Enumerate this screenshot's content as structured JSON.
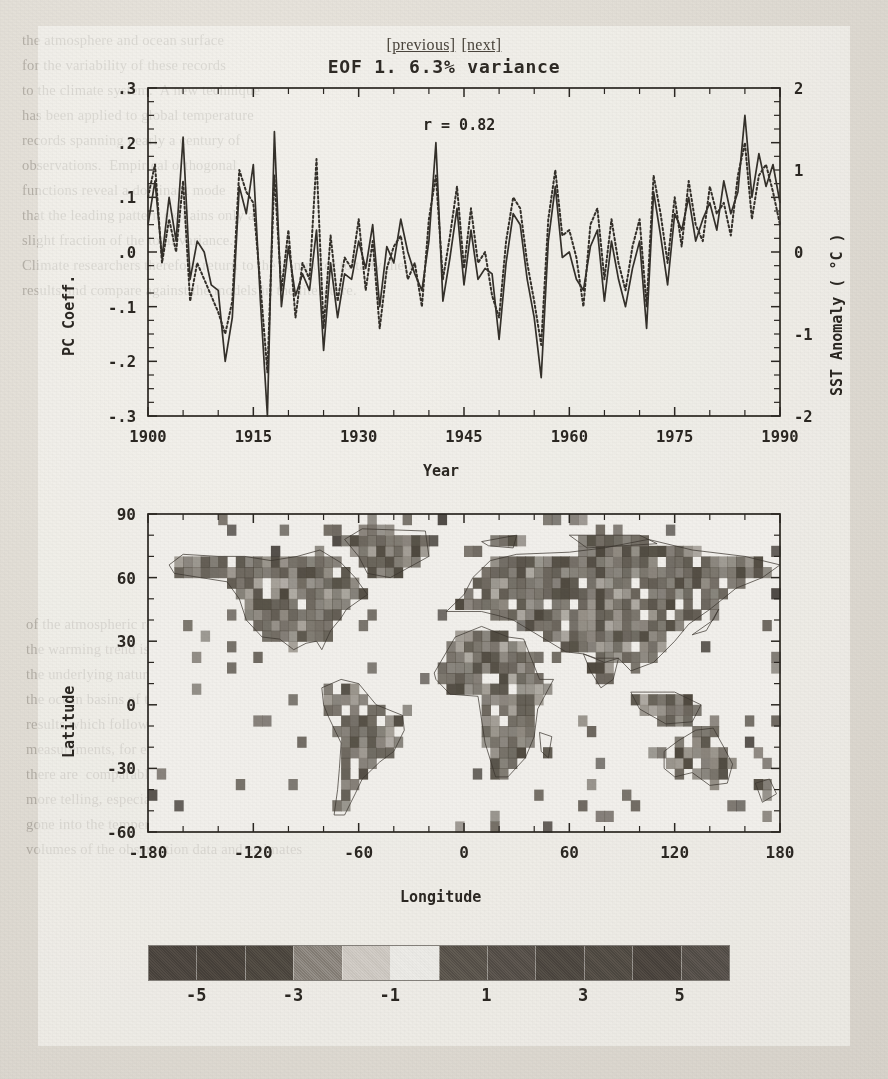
{
  "nav": {
    "previous_label": "[previous]",
    "next_label": "[next]"
  },
  "figure": {
    "title": "EOF 1.  6.3% variance"
  },
  "chart_data": [
    {
      "type": "line",
      "title": "EOF 1.  6.3% variance",
      "xlabel": "Year",
      "ylabel": "PC Coeff.",
      "ylabel_right": "SST Anomaly ( °C )",
      "annotation": "r = 0.82",
      "xlim": [
        1900,
        1990
      ],
      "ylim": [
        -0.3,
        0.3
      ],
      "ylim_right": [
        -2,
        2
      ],
      "grid": false,
      "xticks": [
        1900,
        1915,
        1930,
        1945,
        1960,
        1975,
        1990
      ],
      "xticklabels": [
        "1900",
        "1915",
        "1930",
        "1945",
        "1960",
        "1975",
        "1990"
      ],
      "yticks": [
        0.3,
        0.2,
        0.1,
        0.0,
        -0.1,
        -0.2,
        -0.3
      ],
      "yticklabels": [
        ".3",
        ".2",
        ".1",
        ".0",
        "-.1",
        "-.2",
        "-.3"
      ],
      "yticks_right": [
        2,
        1,
        0,
        -1,
        -2
      ],
      "yticklabels_right": [
        "2",
        "1",
        "0",
        "-1",
        "-2"
      ],
      "series": [
        {
          "name": "PC Coeff. (solid)",
          "style": "solid",
          "x": [
            1900,
            1901,
            1902,
            1903,
            1904,
            1905,
            1906,
            1907,
            1908,
            1909,
            1910,
            1911,
            1912,
            1913,
            1914,
            1915,
            1916,
            1917,
            1918,
            1919,
            1920,
            1921,
            1922,
            1923,
            1924,
            1925,
            1926,
            1927,
            1928,
            1929,
            1930,
            1931,
            1932,
            1933,
            1934,
            1935,
            1936,
            1937,
            1938,
            1939,
            1940,
            1941,
            1942,
            1943,
            1944,
            1945,
            1946,
            1947,
            1948,
            1949,
            1950,
            1951,
            1952,
            1953,
            1954,
            1955,
            1956,
            1957,
            1958,
            1959,
            1960,
            1961,
            1962,
            1963,
            1964,
            1965,
            1966,
            1967,
            1968,
            1969,
            1970,
            1971,
            1972,
            1973,
            1974,
            1975,
            1976,
            1977,
            1978,
            1979,
            1980,
            1981,
            1982,
            1983,
            1984,
            1985,
            1986,
            1987,
            1988,
            1989,
            1990
          ],
          "values": [
            0.05,
            0.13,
            -0.01,
            0.1,
            0.02,
            0.21,
            -0.05,
            0.02,
            0.0,
            -0.06,
            -0.07,
            -0.2,
            -0.12,
            0.12,
            0.07,
            0.16,
            -0.09,
            -0.3,
            0.22,
            -0.1,
            0.01,
            -0.08,
            -0.04,
            -0.07,
            0.04,
            -0.18,
            -0.02,
            -0.12,
            -0.04,
            -0.05,
            0.02,
            -0.03,
            0.05,
            -0.1,
            0.01,
            -0.02,
            0.06,
            0.0,
            -0.04,
            -0.07,
            0.02,
            0.2,
            -0.09,
            -0.01,
            0.08,
            -0.06,
            0.04,
            -0.05,
            -0.03,
            -0.04,
            -0.16,
            -0.02,
            0.07,
            0.05,
            -0.05,
            -0.12,
            -0.23,
            0.02,
            0.12,
            -0.01,
            0.0,
            -0.05,
            -0.07,
            0.01,
            0.04,
            -0.09,
            0.02,
            -0.05,
            -0.1,
            -0.03,
            0.02,
            -0.14,
            0.11,
            0.03,
            -0.06,
            0.07,
            0.04,
            0.1,
            0.02,
            0.06,
            0.09,
            0.04,
            0.13,
            0.07,
            0.11,
            0.25,
            0.1,
            0.18,
            0.12,
            0.16,
            0.09
          ]
        },
        {
          "name": "SST Anomaly (dotted)",
          "style": "dotted",
          "x": [
            1900,
            1901,
            1902,
            1903,
            1904,
            1905,
            1906,
            1907,
            1908,
            1909,
            1910,
            1911,
            1912,
            1913,
            1914,
            1915,
            1916,
            1917,
            1918,
            1919,
            1920,
            1921,
            1922,
            1923,
            1924,
            1925,
            1926,
            1927,
            1928,
            1929,
            1930,
            1931,
            1932,
            1933,
            1934,
            1935,
            1936,
            1937,
            1938,
            1939,
            1940,
            1941,
            1942,
            1943,
            1944,
            1945,
            1946,
            1947,
            1948,
            1949,
            1950,
            1951,
            1952,
            1953,
            1954,
            1955,
            1956,
            1957,
            1958,
            1959,
            1960,
            1961,
            1962,
            1963,
            1964,
            1965,
            1966,
            1967,
            1968,
            1969,
            1970,
            1971,
            1972,
            1973,
            1974,
            1975,
            1976,
            1977,
            1978,
            1979,
            1980,
            1981,
            1982,
            1983,
            1984,
            1985,
            1986,
            1987,
            1988,
            1989,
            1990
          ],
          "values": [
            0.1,
            0.16,
            -0.02,
            0.06,
            0.0,
            0.13,
            -0.09,
            -0.02,
            -0.05,
            -0.08,
            -0.11,
            -0.15,
            -0.09,
            0.15,
            0.11,
            0.09,
            -0.06,
            -0.22,
            0.14,
            -0.07,
            0.04,
            -0.12,
            -0.02,
            -0.05,
            0.17,
            -0.14,
            0.03,
            -0.09,
            -0.01,
            -0.03,
            0.06,
            -0.07,
            0.02,
            -0.14,
            -0.03,
            0.01,
            0.03,
            -0.05,
            -0.02,
            -0.1,
            0.06,
            0.14,
            -0.05,
            0.03,
            0.12,
            -0.03,
            0.08,
            -0.02,
            0.0,
            -0.08,
            -0.12,
            0.02,
            0.1,
            0.08,
            -0.02,
            -0.09,
            -0.17,
            0.06,
            0.15,
            0.03,
            0.04,
            -0.01,
            -0.1,
            0.05,
            0.08,
            -0.05,
            0.06,
            -0.02,
            -0.07,
            0.01,
            0.06,
            -0.1,
            0.14,
            0.07,
            -0.02,
            0.1,
            0.01,
            0.13,
            0.05,
            0.02,
            0.12,
            0.07,
            0.09,
            0.03,
            0.14,
            0.2,
            0.06,
            0.14,
            0.16,
            0.11,
            0.05
          ]
        }
      ]
    },
    {
      "type": "scatter",
      "title": "",
      "xlabel": "Longitude",
      "ylabel": "Latitude",
      "xlim": [
        -180,
        180
      ],
      "ylim": [
        -60,
        90
      ],
      "grid": false,
      "xticks": [
        -180,
        -120,
        -60,
        0,
        60,
        120,
        180
      ],
      "xticklabels": [
        "-180",
        "-120",
        "-60",
        "0",
        "60",
        "120",
        "180"
      ],
      "yticks": [
        90,
        60,
        30,
        0,
        -30,
        -60
      ],
      "yticklabels": [
        "90",
        "60",
        "30",
        "0",
        "-30",
        "-60"
      ],
      "description": "World map with shaded grid cells over continents and scattered ocean points"
    }
  ],
  "colorbar": {
    "ticks": [
      "-5",
      "-3",
      "-1",
      "1",
      "3",
      "5"
    ],
    "tick_values": [
      -5,
      -3,
      -1,
      1,
      3,
      5
    ],
    "range": [
      -6,
      6
    ],
    "colors": [
      "#4c463f",
      "#4a443d",
      "#4e4840",
      "#8b857d",
      "#cfcac3",
      "#ecebe7",
      "#5a544c",
      "#57514a",
      "#4e4841",
      "#524c45",
      "#4b453e",
      "#56504a"
    ]
  },
  "ghost_text": {
    "lines_top": [
      "the atmosphere and ocean surface",
      "for the variability of these records",
      "to the climate system.  A new technique",
      "has been applied to global temperature",
      "records spanning nearly a century of",
      "observations.  Empirical orthogonal",
      "functions reveal a dominant mode",
      "that the leading pattern explains only a",
      "slight fraction of the total variance.",
      "Climate researchers therefore return to the computer to tally their",
      "results and compare against the models in the literature."
    ],
    "lines_bottom": [
      "of the atmospheric record over time.",
      "the warming trend is superimposed on",
      "the underlying natural fluctuations of",
      "the ocean basins of the tropical Pacific",
      "results which follow directly from the",
      "measurements, for each of the decades",
      "there are  comparable anomalies shown",
      "more telling, especially organized over",
      "gone into the temperature records that compose the estimates",
      "volumes of the observation data and estimates"
    ]
  }
}
